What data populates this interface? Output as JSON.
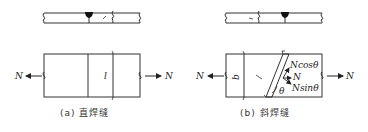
{
  "diagram": {
    "panels": [
      {
        "id": "a",
        "caption": "(a) 直焊缝",
        "force_left": "N",
        "force_right": "N",
        "length_label": "l"
      },
      {
        "id": "b",
        "caption": "(b) 斜焊缝",
        "force_left": "N",
        "force_right": "N",
        "length_label": "l",
        "width_label": "b",
        "angle_label": "θ",
        "components": {
          "cos": "Ncosθ",
          "resultant": "N",
          "sin": "Nsinθ"
        }
      }
    ],
    "colors": {
      "line": "#333333",
      "background": "#ffffff"
    }
  }
}
